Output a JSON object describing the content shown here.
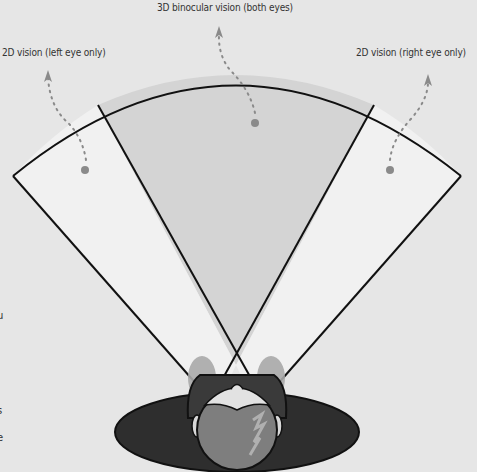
{
  "labels": {
    "binocular": "3D binocular vision (both eyes)",
    "left": "2D vision (left eye only)",
    "right": "2D vision (right eye only)"
  },
  "edge_fragments": [
    "u",
    "s",
    "e"
  ],
  "colors": {
    "background": "#e6e6e6",
    "binocular_zone": "#d4d4d4",
    "monocular_zone": "#f0f0f0",
    "outline": "#111111",
    "marker": "#8a8a8a",
    "head_dark": "#2e2e2e",
    "head_face": "#7c7c7c",
    "eye_cone": "#a8a8a8"
  }
}
